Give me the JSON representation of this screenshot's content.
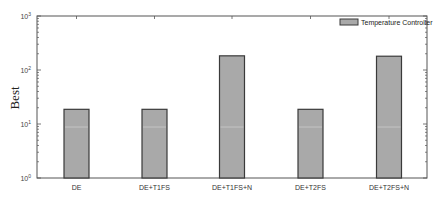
{
  "chart_data": {
    "type": "bar",
    "title": "",
    "xlabel": "",
    "ylabel": "Best",
    "yscale": "log",
    "ylim": [
      1,
      1000
    ],
    "yticks": [
      1,
      10,
      100,
      1000
    ],
    "ytick_labels": [
      {
        "base": "10",
        "exp": "0"
      },
      {
        "base": "10",
        "exp": "1"
      },
      {
        "base": "10",
        "exp": "2"
      },
      {
        "base": "10",
        "exp": "3"
      }
    ],
    "categories": [
      "DE",
      "DE+T1FS",
      "DE+T1FS+N",
      "DE+T2FS",
      "DE+T2FS+N"
    ],
    "series": [
      {
        "name": "Temperature Controller",
        "values": [
          18.7,
          18.7,
          183,
          18.7,
          180
        ],
        "color": "#a9a9a9"
      }
    ],
    "legend": {
      "position": "top-right",
      "entries": [
        "Temperature Controller"
      ]
    },
    "grid": false
  },
  "colors": {
    "bar_fill": "#a9a9a9",
    "bar_edge": "#3a3a3a",
    "axis": "#555555",
    "background": "#ffffff"
  }
}
